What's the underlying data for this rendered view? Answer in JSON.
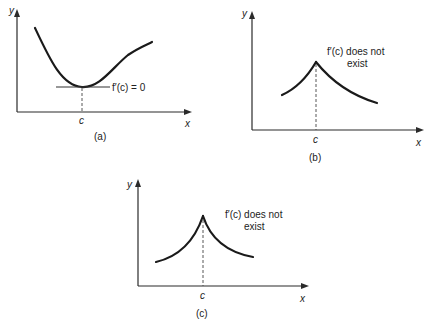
{
  "colors": {
    "ink": "#1a1a1a",
    "background": "#ffffff"
  },
  "panels": [
    {
      "id": "a",
      "caption": "(a)",
      "y_axis_label": "y",
      "x_axis_label": "x",
      "tick_label": "c",
      "annotation_line1": "f′(c) = 0",
      "annotation_line2": "",
      "description": "smooth curve with horizontal tangent at minimum x = c"
    },
    {
      "id": "b",
      "caption": "(b)",
      "y_axis_label": "y",
      "x_axis_label": "x",
      "tick_label": "c",
      "annotation_line1": "f′(c) does not",
      "annotation_line2": "exist",
      "description": "corner (sharp peak) at x = c"
    },
    {
      "id": "c",
      "caption": "(c)",
      "y_axis_label": "y",
      "x_axis_label": "x",
      "tick_label": "c",
      "annotation_line1": "f′(c) does not",
      "annotation_line2": "exist",
      "description": "cusp (vertical tangent) at x = c"
    }
  ]
}
